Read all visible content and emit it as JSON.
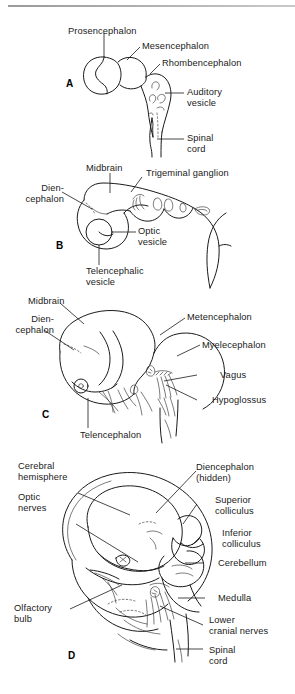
{
  "figure": {
    "panel_letters": [
      "A",
      "B",
      "C",
      "D"
    ]
  },
  "panels": [
    {
      "letter": "A",
      "labels": [
        "Prosencephalon",
        "Mesencephalon",
        "Rhombencephalon",
        "Auditory\nvesicle",
        "Spinal\ncord"
      ]
    },
    {
      "letter": "B",
      "labels": [
        "Midbrain",
        "Trigeminal ganglion",
        "Dien-\ncephalon",
        "Optic\nvesicle",
        "Telencephalic\nvesicle"
      ]
    },
    {
      "letter": "C",
      "labels": [
        "Midbrain",
        "Dien-\ncephalon",
        "Metencephalon",
        "Myelecephalon",
        "Vagus",
        "Hypoglossus",
        "Telencephalon"
      ]
    },
    {
      "letter": "D",
      "labels": [
        "Cerebral\nhemisphere",
        "Optic\nnerves",
        "Diencephalon\n(hidden)",
        "Superior\ncolliculus",
        "Inferior\ncolliculus",
        "Cerebellum",
        "Medulla",
        "Olfactory\nbulb",
        "Lower\ncranial nerves",
        "Spinal\ncord"
      ]
    }
  ],
  "colors": {
    "ink": "#1a1a1a",
    "rule": "#9a9a9a",
    "background": "#ffffff"
  }
}
